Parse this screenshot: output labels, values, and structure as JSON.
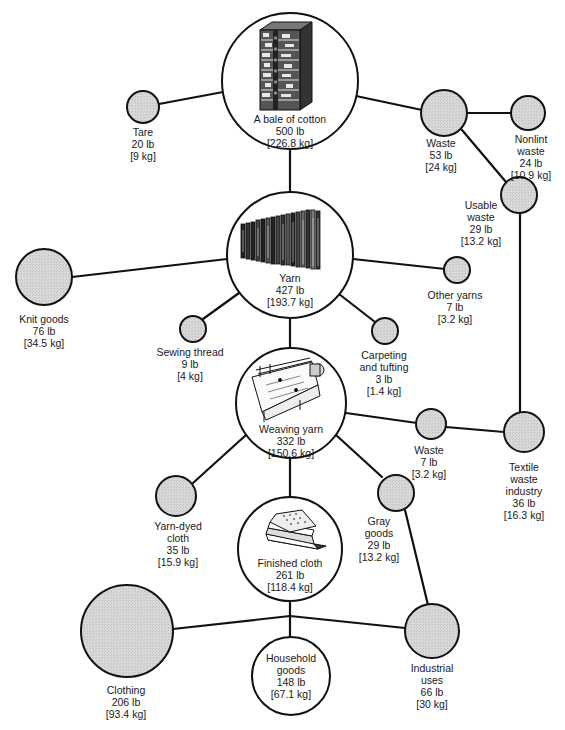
{
  "diagram": {
    "colors": {
      "line": "#111111",
      "node_fill_gray": "#d6d6d6",
      "node_fill_white": "#ffffff"
    },
    "nodes": {
      "bale": {
        "name": "A bale of cotton",
        "lb": "500 lb",
        "kg": "[226.8 kg]",
        "icon": "cotton-bale-icon"
      },
      "tare": {
        "name": "Tare",
        "lb": "20 lb",
        "kg": "[9 kg]"
      },
      "waste1": {
        "name": "Waste",
        "lb": "53 lb",
        "kg": "[24 kg]"
      },
      "nonlint": {
        "name1": "Nonlint",
        "name2": "waste",
        "lb": "24 lb",
        "kg": "[10.9 kg]"
      },
      "usable": {
        "name1": "Usable",
        "name2": "waste",
        "lb": "29 lb",
        "kg": "[13.2 kg]"
      },
      "yarn": {
        "name": "Yarn",
        "lb": "427 lb",
        "kg": "[193.7 kg]",
        "icon": "yarn-bobbins-icon"
      },
      "knit": {
        "name": "Knit goods",
        "lb": "76 lb",
        "kg": "[34.5 kg]"
      },
      "sewing": {
        "name": "Sewing thread",
        "lb": "9 lb",
        "kg": "[4 kg]"
      },
      "carpeting": {
        "name1": "Carpeting",
        "name2": "and tufting",
        "lb": "3 lb",
        "kg": "[1.4 kg]"
      },
      "other": {
        "name": "Other yarns",
        "lb": "7 lb",
        "kg": "[3.2 kg]"
      },
      "weaving": {
        "name": "Weaving yarn",
        "lb": "332 lb",
        "kg": "[150.6 kg]",
        "icon": "loom-machine-icon"
      },
      "waste2": {
        "name": "Waste",
        "lb": "7 lb",
        "kg": "[3.2 kg]"
      },
      "textile": {
        "name1": "Textile",
        "name2": "waste",
        "name3": "industry",
        "lb": "36 lb",
        "kg": "[16.3 kg]"
      },
      "yarndyed": {
        "name1": "Yarn-dyed",
        "name2": "cloth",
        "lb": "35 lb",
        "kg": "[15.9 kg]"
      },
      "gray": {
        "name1": "Gray",
        "name2": "goods",
        "lb": "29 lb",
        "kg": "[13.2 kg]"
      },
      "finished": {
        "name": "Finished cloth",
        "lb": "261 lb",
        "kg": "[118.4 kg]",
        "icon": "folded-cloth-icon"
      },
      "clothing": {
        "name": "Clothing",
        "lb": "206 lb",
        "kg": "[93.4 kg]"
      },
      "household": {
        "name1": "Household",
        "name2": "goods",
        "lb": "148 lb",
        "kg": "[67.1 kg]"
      },
      "industrial": {
        "name1": "Industrial",
        "name2": "uses",
        "lb": "66 lb",
        "kg": "[30 kg]"
      }
    }
  }
}
